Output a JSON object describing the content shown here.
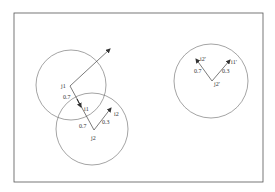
{
  "colors": {
    "stroke": "#555555",
    "text": "#333333",
    "background": "#ffffff"
  },
  "frame": {
    "x": 14,
    "y": 13,
    "w": 249,
    "h": 169
  },
  "circles": [
    {
      "id": "j1-circle",
      "cx": 71,
      "cy": 85,
      "r": 35
    },
    {
      "id": "j2-circle",
      "cx": 92,
      "cy": 129,
      "r": 36
    },
    {
      "id": "j2prime-circle",
      "cx": 211,
      "cy": 81,
      "r": 37
    }
  ],
  "labels": {
    "j1": "j1",
    "j2": "j2",
    "i1": "i1",
    "i2": "i2",
    "w_j1_i1": "0.7",
    "w_j2_i1": "0.7",
    "w_j2_i2": "0.3",
    "j2p": "j2'",
    "i1p": "i1'",
    "i2p": "i2'",
    "w_j2p_i2p": "0.7",
    "w_j2p_i1p": "0.3"
  }
}
